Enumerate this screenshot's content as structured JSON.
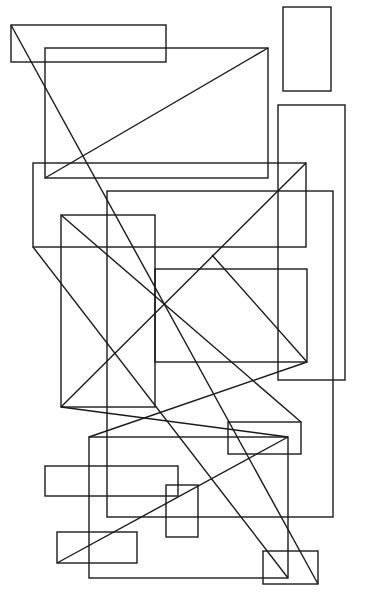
{
  "canvas": {
    "width": 371,
    "height": 611,
    "background": "#ffffff",
    "stroke": "#1a1a1a"
  },
  "rects": [
    {
      "id": "r1",
      "x": 11,
      "y": 25,
      "w": 155,
      "h": 37
    },
    {
      "id": "r2",
      "x": 45,
      "y": 48,
      "w": 223,
      "h": 130
    },
    {
      "id": "r3",
      "x": 283,
      "y": 7,
      "w": 48,
      "h": 84
    },
    {
      "id": "r4",
      "x": 278,
      "y": 105,
      "w": 67,
      "h": 275
    },
    {
      "id": "r5",
      "x": 33,
      "y": 163,
      "w": 273,
      "h": 84
    },
    {
      "id": "r6",
      "x": 107,
      "y": 191,
      "w": 226,
      "h": 326
    },
    {
      "id": "r7",
      "x": 61,
      "y": 215,
      "w": 94,
      "h": 192
    },
    {
      "id": "r8",
      "x": 155,
      "y": 269,
      "w": 152,
      "h": 93
    },
    {
      "id": "r9",
      "x": 228,
      "y": 422,
      "w": 73,
      "h": 32
    },
    {
      "id": "r10",
      "x": 89,
      "y": 437,
      "w": 199,
      "h": 141
    },
    {
      "id": "r11",
      "x": 45,
      "y": 466,
      "w": 133,
      "h": 30
    },
    {
      "id": "r12",
      "x": 166,
      "y": 485,
      "w": 32,
      "h": 52
    },
    {
      "id": "r13",
      "x": 57,
      "y": 532,
      "w": 80,
      "h": 31
    },
    {
      "id": "r14",
      "x": 263,
      "y": 551,
      "w": 55,
      "h": 33
    }
  ],
  "lines": [
    {
      "id": "l1",
      "x1": 11,
      "y1": 25,
      "x2": 318,
      "y2": 584
    },
    {
      "id": "l2",
      "x1": 45,
      "y1": 178,
      "x2": 268,
      "y2": 48
    },
    {
      "id": "l3",
      "x1": 33,
      "y1": 247,
      "x2": 288,
      "y2": 578
    },
    {
      "id": "l4",
      "x1": 61,
      "y1": 407,
      "x2": 306,
      "y2": 163
    },
    {
      "id": "l5",
      "x1": 61,
      "y1": 215,
      "x2": 301,
      "y2": 422
    },
    {
      "id": "l6",
      "x1": 61,
      "y1": 407,
      "x2": 288,
      "y2": 437
    },
    {
      "id": "l7",
      "x1": 89,
      "y1": 437,
      "x2": 307,
      "y2": 362
    },
    {
      "id": "l8",
      "x1": 57,
      "y1": 563,
      "x2": 288,
      "y2": 437
    },
    {
      "id": "l9",
      "x1": 212,
      "y1": 255,
      "x2": 307,
      "y2": 362
    }
  ]
}
